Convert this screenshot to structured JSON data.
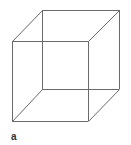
{
  "figure": {
    "type": "necker-cube",
    "panel_label": "a",
    "line_color": "#6a6a6a",
    "vertices": {
      "front_top_left": [
        12,
        41
      ],
      "front_top_right": [
        88,
        41
      ],
      "front_bottom_left": [
        12,
        121
      ],
      "front_bottom_right": [
        88,
        121
      ],
      "back_top_left": [
        42,
        10
      ],
      "back_top_right": [
        119,
        10
      ],
      "back_bottom_left": [
        42,
        89
      ],
      "back_bottom_right": [
        119,
        89
      ]
    }
  }
}
